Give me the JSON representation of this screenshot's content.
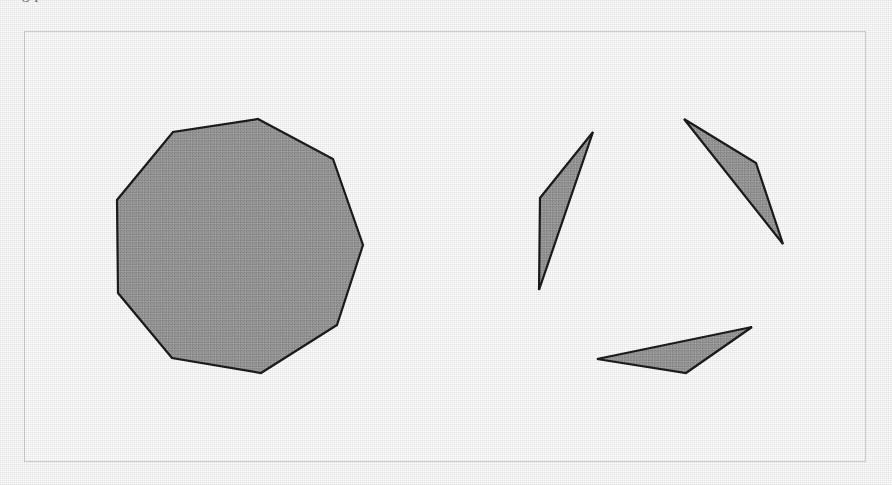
{
  "page": {
    "width": 892,
    "height": 485,
    "background_color": "#ffffff",
    "media": "scanned-document-figure"
  },
  "clipped_header": {
    "text": "g       p",
    "note": "running text clipped by the top crop of the scan; only descenders legible"
  },
  "frame": {
    "name": "figure-border",
    "x": 24,
    "y": 31,
    "width": 842,
    "height": 431,
    "stroke_color": "#d2d2d2",
    "stroke_width": 1,
    "fill_color": "#ffffff"
  },
  "style": {
    "shape_fill": "#9b9b9b",
    "shape_stroke": "#1c1c1c",
    "shape_stroke_width": 2.2
  },
  "shapes": [
    {
      "id": "decagon",
      "label": "large convex polygon",
      "kind": "polygon",
      "sides": 10,
      "points": "258,119 333,159 363,245 337,325 261,373 172,358 118,293 117,200 173,132 258,119",
      "fill": "#9b9b9b",
      "stroke": "#1c1c1c"
    },
    {
      "id": "sliver-triangle-left",
      "label": "thin sliver triangle, upper left of cluster",
      "kind": "polygon",
      "sides": 3,
      "points": "593,132 540,198 539,290 593,132",
      "fill": "#9b9b9b",
      "stroke": "#1c1c1c"
    },
    {
      "id": "sliver-triangle-right",
      "label": "thin sliver triangle, upper right of cluster",
      "kind": "polygon",
      "sides": 3,
      "points": "684,119 756,163 783,244 684,119",
      "fill": "#9b9b9b",
      "stroke": "#1c1c1c"
    },
    {
      "id": "sliver-triangle-bottom",
      "label": "thin sliver triangle, bottom of cluster",
      "kind": "polygon",
      "sides": 3,
      "points": "752,327 686,373 597,359 752,327",
      "fill": "#9b9b9b",
      "stroke": "#1c1c1c"
    }
  ]
}
